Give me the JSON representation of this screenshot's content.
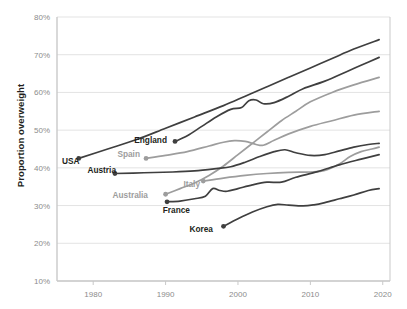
{
  "chart_data": {
    "type": "line",
    "title": "",
    "xlabel": "",
    "ylabel": "Proportion overweight",
    "xlim": [
      1975,
      2021
    ],
    "ylim": [
      10,
      80
    ],
    "grid": true,
    "legend_position": "inline-labels",
    "x_ticks": [
      "1980",
      "1990",
      "2000",
      "2010",
      "2020"
    ],
    "x_tick_values": [
      1980,
      1990,
      2000,
      2010,
      2020
    ],
    "y_ticks": [
      "10%",
      "20%",
      "30%",
      "40%",
      "50%",
      "60%",
      "70%",
      "80%"
    ],
    "y_tick_values": [
      10,
      20,
      30,
      40,
      50,
      60,
      70,
      80
    ],
    "series": [
      {
        "name": "USA",
        "label": "USA",
        "color": "#3f3f3f",
        "label_style": "dark",
        "marker_x": 1978,
        "marker_y": 42.5,
        "x": [
          1978,
          1982,
          1986,
          1990,
          1994,
          1998,
          2001,
          2004,
          2007,
          2010,
          2013,
          2016,
          2019.5
        ],
        "values": [
          42.5,
          45.0,
          47.5,
          50.5,
          53.5,
          56.5,
          59.0,
          61.5,
          64.0,
          66.5,
          69.0,
          71.5,
          74.0
        ]
      },
      {
        "name": "England",
        "label": "England",
        "color": "#3f3f3f",
        "label_style": "dark",
        "marker_x": 1991.3,
        "marker_y": 47.0,
        "x": [
          1991.3,
          1993,
          1995,
          1997,
          1999,
          2000.5,
          2001.5,
          2002.5,
          2003.5,
          2005,
          2007,
          2009,
          2012,
          2015,
          2017,
          2019.5
        ],
        "values": [
          47.0,
          48.5,
          51.0,
          53.5,
          55.5,
          56.0,
          57.8,
          58.0,
          57.0,
          57.3,
          59.0,
          61.0,
          63.0,
          65.5,
          67.2,
          69.3
        ]
      },
      {
        "name": "Spain",
        "label": "Spain",
        "color": "#9d9d9d",
        "label_style": "light",
        "marker_x": 1987.3,
        "marker_y": 42.5,
        "x": [
          1987.3,
          1990,
          1993,
          1996,
          1998,
          1999.5,
          2001,
          2002.5,
          2003.5,
          2005,
          2007,
          2010,
          2013,
          2016,
          2019.5
        ],
        "values": [
          42.5,
          43.3,
          44.3,
          45.8,
          46.8,
          47.2,
          47.0,
          46.2,
          46.0,
          47.3,
          49.0,
          51.0,
          52.5,
          54.0,
          55.0
        ]
      },
      {
        "name": "Australia",
        "label": "Australia",
        "color": "#9d9d9d",
        "label_style": "light",
        "marker_x": 1990,
        "marker_y": 33.0,
        "x": [
          1990,
          1992,
          1994,
          1996,
          1998,
          2000,
          2002,
          2004,
          2006,
          2008,
          2010,
          2013,
          2016,
          2019.5
        ],
        "values": [
          33.0,
          34.5,
          36.0,
          38.0,
          40.5,
          43.5,
          46.5,
          49.5,
          52.5,
          55.0,
          57.5,
          60.0,
          62.0,
          64.0
        ]
      },
      {
        "name": "Austria",
        "label": "Austria",
        "color": "#3f3f3f",
        "label_style": "dark",
        "marker_x": 1983,
        "marker_y": 38.5,
        "x": [
          1983,
          1987,
          1991,
          1994,
          1997,
          1999,
          2001,
          2003,
          2005,
          2006.5,
          2008,
          2010,
          2012,
          2014,
          2016,
          2018,
          2019.5
        ],
        "values": [
          38.5,
          38.7,
          38.9,
          39.2,
          39.8,
          40.3,
          41.5,
          43.0,
          44.3,
          44.8,
          44.0,
          43.3,
          43.5,
          44.5,
          45.5,
          46.2,
          46.5
        ]
      },
      {
        "name": "Italy",
        "label": "Italy",
        "color": "#9d9d9d",
        "label_style": "light",
        "marker_x": 1995.2,
        "marker_y": 36.5,
        "x": [
          1995.2,
          1998,
          2001,
          2004,
          2007,
          2010,
          2012,
          2014,
          2015.5,
          2017,
          2018.5,
          2019.5
        ],
        "values": [
          36.5,
          37.3,
          38.0,
          38.5,
          38.8,
          38.9,
          39.3,
          41.0,
          43.0,
          44.3,
          45.0,
          45.5
        ]
      },
      {
        "name": "France",
        "label": "France",
        "color": "#3f3f3f",
        "label_style": "dark",
        "marker_x": 1990.2,
        "marker_y": 31.0,
        "x": [
          1990.2,
          1992,
          1994,
          1995.5,
          1996.5,
          1997.5,
          1998.5,
          2000,
          2002,
          2004,
          2006,
          2008,
          2011,
          2014,
          2017,
          2019.5
        ],
        "values": [
          31.0,
          31.2,
          31.8,
          32.5,
          34.5,
          34.0,
          33.8,
          34.5,
          35.5,
          36.2,
          36.2,
          37.5,
          39.0,
          40.8,
          42.3,
          43.5
        ]
      },
      {
        "name": "Korea",
        "label": "Korea",
        "color": "#3f3f3f",
        "label_style": "dark",
        "marker_x": 1998,
        "marker_y": 24.5,
        "x": [
          1998,
          2000,
          2002,
          2004,
          2005.5,
          2007,
          2009,
          2010.5,
          2012,
          2014,
          2016,
          2018,
          2019.5
        ],
        "values": [
          24.5,
          26.5,
          28.3,
          29.7,
          30.3,
          30.1,
          29.9,
          30.2,
          30.8,
          31.8,
          32.8,
          34.0,
          34.5
        ]
      }
    ],
    "series_labels": [
      {
        "name": "USA",
        "text": "USA",
        "style": "dark",
        "x": 62,
        "y": 164,
        "anchor": "start"
      },
      {
        "name": "England",
        "text": "England",
        "style": "dark",
        "x": 167,
        "y": 143,
        "anchor": "end"
      },
      {
        "name": "Spain",
        "text": "Spain",
        "style": "light",
        "x": 140,
        "y": 157,
        "anchor": "end"
      },
      {
        "name": "Austria",
        "text": "Austria",
        "style": "dark",
        "x": 116,
        "y": 173,
        "anchor": "end"
      },
      {
        "name": "Australia",
        "text": "Australia",
        "style": "light",
        "x": 148,
        "y": 198,
        "anchor": "end"
      },
      {
        "name": "Italy",
        "text": "Italy",
        "style": "light",
        "x": 200,
        "y": 187,
        "anchor": "end"
      },
      {
        "name": "France",
        "text": "France",
        "style": "dark",
        "x": 190,
        "y": 213,
        "anchor": "end"
      },
      {
        "name": "Korea",
        "text": "Korea",
        "style": "dark",
        "x": 213,
        "y": 232,
        "anchor": "end"
      }
    ]
  },
  "colors": {
    "dark_line": "#3f3f3f",
    "light_line": "#9d9d9d",
    "grid": "#e3e3e3",
    "axis": "#c9c9c9",
    "tick_text": "#8c8c8c",
    "label_dark": "#231f20",
    "label_light": "#9d9d9d",
    "background": "#ffffff"
  }
}
